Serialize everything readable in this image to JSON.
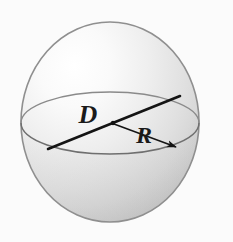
{
  "figure": {
    "name": "sphere-diameter-radius-diagram",
    "title": "Sphere with diameter D and radius R",
    "background_color": "#fbfbfb",
    "canvas": {
      "width": 233,
      "height": 242
    },
    "sphere": {
      "center_x": 110,
      "center_y": 122,
      "radius_x": 89,
      "radius_y": 100,
      "outline_color": "#8c8c8c",
      "fill_light": "#fdfdfd",
      "fill_mid": "#e2e2e2",
      "fill_dark": "#c2c2c2",
      "highlight_x": 70,
      "highlight_y": 62
    },
    "equator": {
      "name": "equator-ellipse",
      "center_x": 110,
      "center_y": 123,
      "radius_x": 89,
      "radius_y": 31,
      "stroke_color": "#7a7a7a"
    },
    "diameter_segment": {
      "name": "diameter-line",
      "label": "D",
      "x1": 48,
      "y1": 149,
      "x2": 180,
      "y2": 96,
      "stroke_color": "#141414",
      "stroke_width": 2.6,
      "label_x": 88,
      "label_y": 123,
      "label_size": 26
    },
    "radius_segment": {
      "name": "radius-arrow",
      "label": "R",
      "x1": 113,
      "y1": 123,
      "x2": 179,
      "y2": 148,
      "stroke_color": "#141414",
      "stroke_width": 1.5,
      "label_x": 144,
      "label_y": 143,
      "label_size": 24,
      "arrowhead": "filled-triangle"
    },
    "center_dot": {
      "name": "sphere-center-point",
      "x": 113,
      "y": 123,
      "r": 2.2,
      "color": "#141414"
    }
  }
}
